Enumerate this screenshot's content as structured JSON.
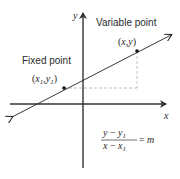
{
  "diagram": {
    "axes": {
      "x_label": "x",
      "y_label": "y"
    },
    "points": {
      "fixed": {
        "caption": "Fixed point",
        "coord_open": "(",
        "coord_x": "x",
        "coord_x_sub": "1",
        "coord_sep": ",",
        "coord_y": "y",
        "coord_y_sub": "1",
        "coord_close": ")"
      },
      "variable": {
        "caption": "Variable point",
        "coord_open": "(",
        "coord_x": "x",
        "coord_sep": ",",
        "coord_y": "y",
        "coord_close": ")"
      }
    },
    "formula": {
      "numerator_var": "y",
      "numerator_op": " − ",
      "numerator_sub_var": "y",
      "numerator_sub": "1",
      "denominator_var": "x",
      "denominator_op": " − ",
      "denominator_sub_var": "x",
      "denominator_sub": "1",
      "equals": "=",
      "rhs": "m"
    },
    "colors": {
      "axis": "#333333",
      "line": "#222222",
      "dashed": "#b0b0b0",
      "point": "#111111"
    }
  }
}
